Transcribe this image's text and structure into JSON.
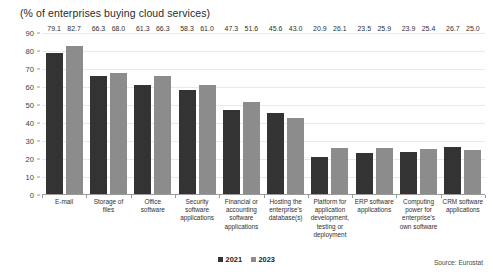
{
  "chart_data": {
    "type": "bar",
    "title": "(% of enterprises buying cloud services)",
    "xlabel": "",
    "ylabel": "",
    "ylim": [
      0,
      90
    ],
    "yticks": [
      0,
      10,
      20,
      30,
      40,
      50,
      60,
      70,
      80,
      90
    ],
    "grid": true,
    "legend_position": "bottom-center",
    "source": "Source: Eurostat",
    "categories": [
      "E-mail",
      "Storage of files",
      "Office software",
      "Security software applications",
      "Financial or accounting software applications",
      "Hosting the enterprise's database(s)",
      "Platform for application development, testing or deployment",
      "ERP software applications",
      "Computing power for enterprise's own software",
      "CRM software applications"
    ],
    "series": [
      {
        "name": "2021",
        "color": "#333333",
        "values": [
          79.1,
          66.3,
          61.3,
          58.3,
          47.3,
          45.6,
          20.9,
          23.5,
          23.9,
          26.7
        ]
      },
      {
        "name": "2023",
        "color": "#8c8c8c",
        "values": [
          82.7,
          68.0,
          66.3,
          61.0,
          51.6,
          43.0,
          26.1,
          25.9,
          25.4,
          25.0
        ]
      }
    ]
  }
}
